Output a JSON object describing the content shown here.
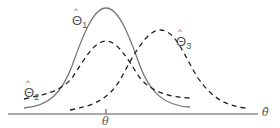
{
  "diagram": {
    "axis": {
      "label": "θ̂",
      "tick_label": "θ"
    },
    "curves": [
      {
        "name": "Θ̂1",
        "label_text": "Θ",
        "subscript": "1",
        "style": "solid",
        "color": "#777777",
        "peak_position": "at θ",
        "width": "narrow"
      },
      {
        "name": "Θ̂2",
        "label_text": "Θ",
        "subscript": "2",
        "style": "dashed",
        "color": "#222222",
        "peak_position": "at θ",
        "width": "wide"
      },
      {
        "name": "Θ̂3",
        "label_text": "Θ",
        "subscript": "3",
        "style": "dashed",
        "color": "#222222",
        "peak_position": "right of θ",
        "width": "medium"
      }
    ],
    "colors": {
      "axis": "#555555",
      "solid_curve": "#777777",
      "dashed_curve": "#222222"
    }
  }
}
